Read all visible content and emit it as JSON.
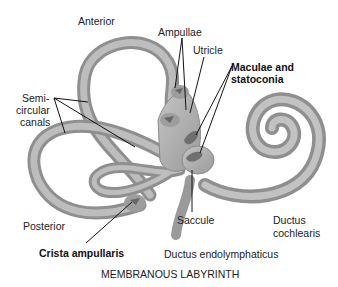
{
  "title": "MEMBRANOUS LABYRINTH",
  "labels": {
    "anterior": "Anterior",
    "ampullae": "Ampullae",
    "utricle": "Utricle",
    "maculae_line1": "Maculae and",
    "maculae_line2": "statoconia",
    "semi_line1": "Semi-",
    "semi_line2": "circular",
    "semi_line3": "canals",
    "posterior": "Posterior",
    "crista": "Crista ampullaris",
    "saccule": "Saccule",
    "ductus_cochlearis_line1": "Ductus",
    "ductus_cochlearis_line2": "cochlearis",
    "ductus_endolymphaticus": "Ductus endolymphaticus"
  },
  "colors": {
    "tube": "#a9a9a9",
    "tube_dark": "#8c8c8c",
    "tube_light": "#c9c9c9",
    "macula": "#6f6f6f",
    "leader": "#111111"
  }
}
